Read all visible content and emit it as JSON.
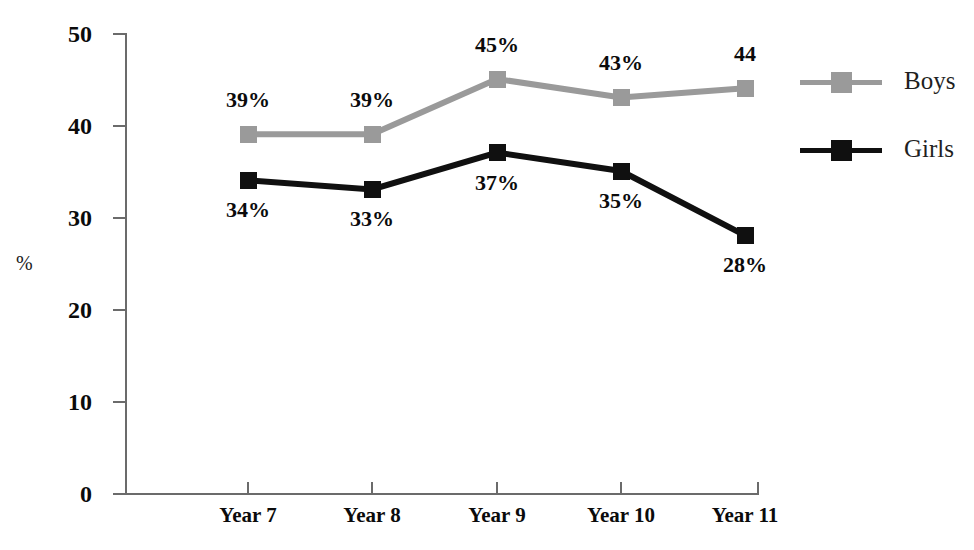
{
  "chart_data": {
    "type": "line",
    "title": "",
    "xlabel": "",
    "ylabel": "%",
    "categories": [
      "Year 7",
      "Year 8",
      "Year 9",
      "Year 10",
      "Year 11"
    ],
    "ylim": [
      0,
      50
    ],
    "ytick_values": [
      0,
      10,
      20,
      30,
      40,
      50
    ],
    "ytick_labels": [
      "0",
      "10",
      "20",
      "30",
      "40",
      "50"
    ],
    "grid": false,
    "legend_position": "right",
    "series": [
      {
        "name": "Boys",
        "color": "#9a9a9a",
        "values": [
          39,
          39,
          45,
          43,
          44
        ],
        "data_labels": [
          "39%",
          "39%",
          "45%",
          "43%",
          "44"
        ],
        "label_side": [
          "above",
          "above",
          "above",
          "above",
          "above"
        ]
      },
      {
        "name": "Girls",
        "color": "#101010",
        "values": [
          34,
          33,
          37,
          35,
          28
        ],
        "data_labels": [
          "34%",
          "33%",
          "37%",
          "35%",
          "28%"
        ],
        "label_side": [
          "below",
          "below",
          "below",
          "below",
          "below"
        ]
      }
    ]
  },
  "legend": {
    "entries": [
      {
        "label": "Boys"
      },
      {
        "label": "Girls"
      }
    ]
  },
  "axis": {
    "y_title": "%",
    "y_labels": [
      "50",
      "40",
      "30",
      "20",
      "10",
      "0"
    ],
    "x_labels": [
      "Year 7",
      "Year 8",
      "Year 9",
      "Year 10",
      "Year 11"
    ]
  },
  "labels": {
    "boys": [
      "39%",
      "39%",
      "45%",
      "43%",
      "44"
    ],
    "girls": [
      "34%",
      "33%",
      "37%",
      "35%",
      "28%"
    ]
  }
}
